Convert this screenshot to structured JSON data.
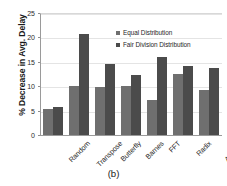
{
  "chart_data": {
    "type": "bar",
    "title": "",
    "subtitle": "",
    "caption": "(b)",
    "xlabel": "",
    "ylabel": "% Decrease in Avg. Delay",
    "categories": [
      "Random",
      "Transpose",
      "Butterfly",
      "Barnes",
      "FFT",
      "Radix",
      "Average"
    ],
    "series": [
      {
        "name": "Equal Distribution",
        "color": "#6f6f6f",
        "values": [
          5.3,
          10.0,
          9.8,
          10.1,
          7.2,
          12.6,
          9.2
        ]
      },
      {
        "name": "Fair Division Distribution",
        "color": "#4b4b4b",
        "values": [
          5.7,
          20.7,
          14.6,
          12.2,
          15.9,
          14.1,
          13.8
        ]
      }
    ],
    "ylim": [
      0,
      25
    ],
    "yticks": [
      0,
      5,
      10,
      15,
      20,
      25
    ],
    "ytick_labels": [
      "0",
      "5",
      "10",
      "15",
      "20",
      "25"
    ],
    "grid": true,
    "grid_axis": "y",
    "legend_position": "top-right-inside",
    "xtick_rotation": -45
  }
}
